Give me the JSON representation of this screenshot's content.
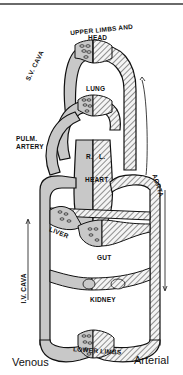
{
  "diagram": {
    "labels": {
      "upper": "UPPER LIMBS AND",
      "head": "HEAD",
      "lung": "LUNG",
      "svcava": "S.V. CAVA",
      "pulm1": "PULM.",
      "pulm2": "ARTERY",
      "right": "R.",
      "left": "L.",
      "heart": "HEART",
      "aorta": "AORTA",
      "liver": "LIVER",
      "gut": "GUT",
      "ivcava": "I.V. CAVA",
      "kidney": "KIDNEY",
      "lower": "LOWER LIMBS"
    },
    "legend": {
      "venous": "Venous",
      "arterial": "Arterial"
    },
    "colors": {
      "venous_fill": "#c8c8c8",
      "arterial_hatch": "#4a4a4a",
      "outline": "#111111"
    }
  }
}
